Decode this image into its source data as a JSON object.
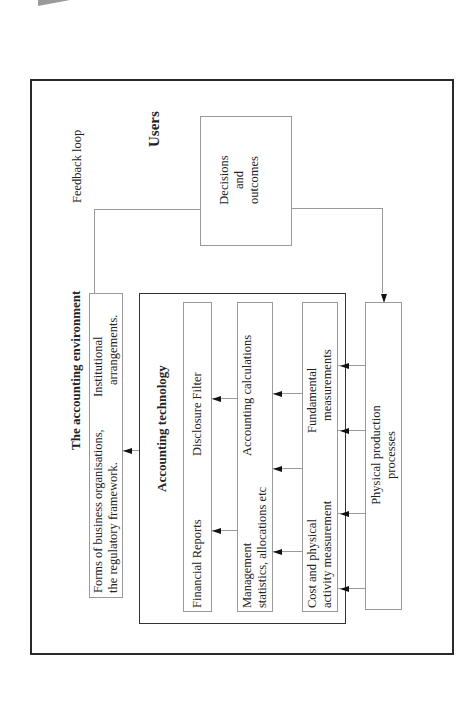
{
  "diagram": {
    "title": "The accounting environment",
    "users_label": "Users",
    "feedback_label": "Feedback loop",
    "institutional_box": {
      "line1_left": "Forms of business organisations,",
      "line2_left": "the regulatory framework.",
      "line1_right": "Institutional",
      "line2_right": "arrangements."
    },
    "decisions_box": {
      "line1": "Decisions",
      "line2": "and",
      "line3": "outcomes"
    },
    "accounting_technology": {
      "title": "Accounting technology",
      "rows": [
        {
          "left_line1": "Financial Reports",
          "left_line2": "",
          "right_line1": "Disclosure Filter",
          "right_line2": ""
        },
        {
          "left_line1": "Management",
          "left_line2": "statistics, allocations etc",
          "right_line1": "Accounting calculations",
          "right_line2": ""
        },
        {
          "left_line1": "Cost and physical",
          "left_line2": "activity measurement",
          "right_line1": "Fundamental",
          "right_line2": "measurements"
        }
      ]
    },
    "physical_box": {
      "line1": "Physical production",
      "line2": "processes"
    },
    "colors": {
      "frame": "#2a2a2a",
      "box_border": "#9a9a9a",
      "arrow": "#111111",
      "text": "#222222"
    }
  }
}
